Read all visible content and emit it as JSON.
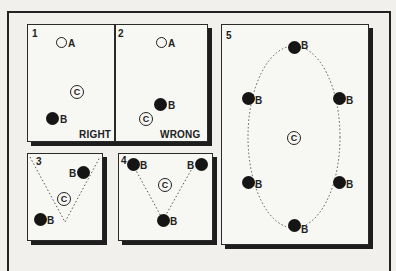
{
  "figure": {
    "panels": [
      {
        "number": "1",
        "caption": "RIGHT",
        "markers": [
          {
            "type": "open-circle",
            "label": "A"
          },
          {
            "type": "circled-letter",
            "label": "C"
          },
          {
            "type": "filled-circle",
            "label": "B"
          }
        ]
      },
      {
        "number": "2",
        "caption": "WRONG",
        "markers": [
          {
            "type": "open-circle",
            "label": "A"
          },
          {
            "type": "filled-circle",
            "label": "B"
          },
          {
            "type": "circled-letter",
            "label": "C"
          }
        ]
      },
      {
        "number": "3",
        "caption": "",
        "markers": [
          {
            "type": "filled-circle",
            "label": "B"
          },
          {
            "type": "circled-letter",
            "label": "C"
          },
          {
            "type": "filled-circle",
            "label": "B"
          }
        ],
        "path": "dotted V"
      },
      {
        "number": "4",
        "caption": "",
        "markers": [
          {
            "type": "filled-circle",
            "label": "B"
          },
          {
            "type": "filled-circle",
            "label": "B"
          },
          {
            "type": "circled-letter",
            "label": "C"
          },
          {
            "type": "filled-circle",
            "label": "B"
          }
        ],
        "path": "dotted V"
      },
      {
        "number": "5",
        "caption": "",
        "markers": [
          {
            "type": "filled-circle",
            "label": "B"
          },
          {
            "type": "filled-circle",
            "label": "B"
          },
          {
            "type": "filled-circle",
            "label": "B"
          },
          {
            "type": "circled-letter",
            "label": "C"
          },
          {
            "type": "filled-circle",
            "label": "B"
          },
          {
            "type": "filled-circle",
            "label": "B"
          },
          {
            "type": "filled-circle",
            "label": "B"
          }
        ],
        "path": "dotted ellipse"
      }
    ]
  }
}
